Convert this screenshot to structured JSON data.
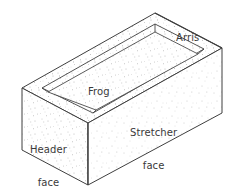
{
  "figure": {
    "projection": "isometric",
    "background_color": "#ffffff",
    "line_color": "#3f3f3f",
    "speckle_color": "#b9b9b9",
    "text_color": "#3a3a3a"
  },
  "labels": {
    "arris": "Arris",
    "frog": "Frog",
    "stretcher_face_line1": "Stretcher",
    "stretcher_face_line2": "face",
    "header_face_line1": "Header",
    "header_face_line2": "face"
  },
  "parts": {
    "arris_name": "arris-edge",
    "frog_name": "frog-recess",
    "stretcher_name": "stretcher-face",
    "header_name": "header-face",
    "bed_name": "bed-face-top"
  }
}
